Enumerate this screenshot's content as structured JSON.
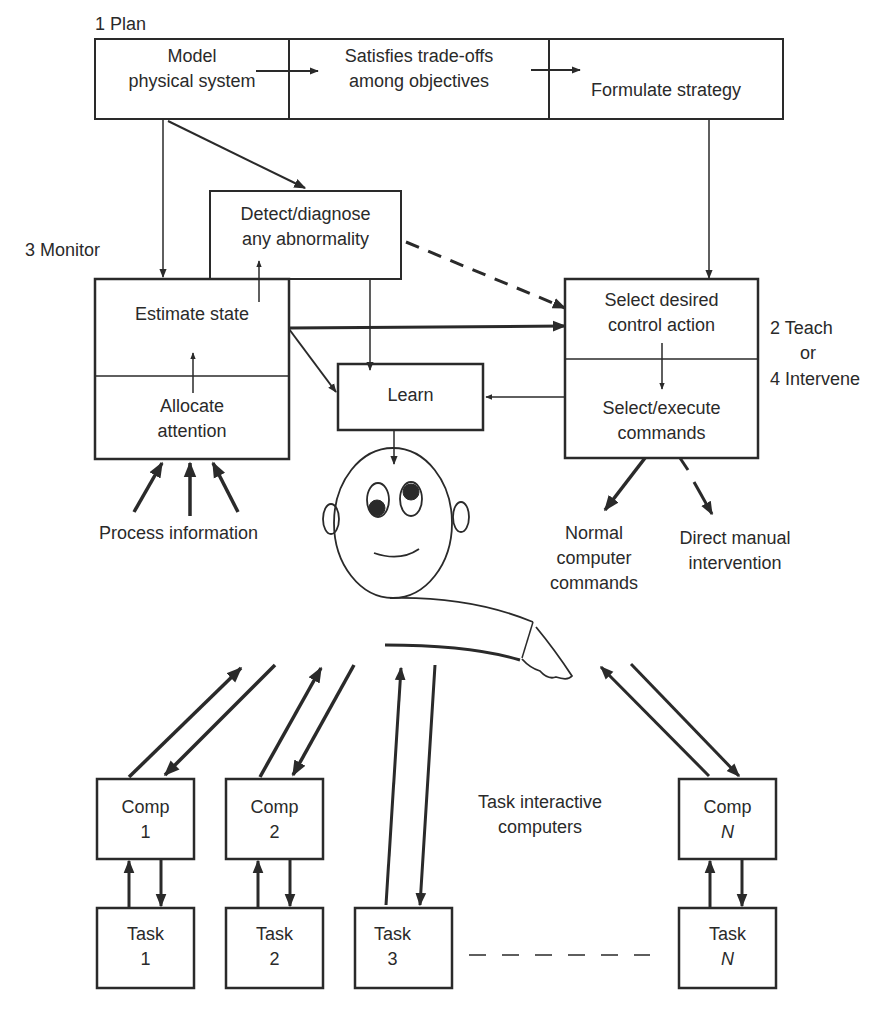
{
  "diagram": {
    "type": "supervisory-control-diagram",
    "labels": {
      "plan": "1 Plan",
      "monitor": "3 Monitor",
      "teach": "2 Teach",
      "or": "or",
      "intervene": "4 Intervene",
      "process_information": "Process information",
      "task_interactive": [
        "Task interactive",
        "computers"
      ]
    },
    "plan_boxes": [
      {
        "lines": [
          "Model",
          "physical system"
        ]
      },
      {
        "lines": [
          "Satisfies trade-offs",
          "among objectives"
        ]
      },
      {
        "lines": [
          "Formulate strategy"
        ]
      }
    ],
    "detect_box": {
      "lines": [
        "Detect/diagnose",
        "any abnormality"
      ]
    },
    "monitor_box": {
      "top": {
        "lines": [
          "Estimate state"
        ]
      },
      "bottom": {
        "lines": [
          "Allocate",
          "attention"
        ]
      }
    },
    "learn_box": {
      "lines": [
        "Learn"
      ]
    },
    "control_box": {
      "top": {
        "lines": [
          "Select desired",
          "control action"
        ]
      },
      "bottom": {
        "lines": [
          "Select/execute",
          "commands"
        ]
      }
    },
    "outputs": {
      "normal": [
        "Normal",
        "computer",
        "commands"
      ],
      "direct": [
        "Direct manual",
        "intervention"
      ]
    },
    "computers": [
      {
        "label": "Comp",
        "index": "1"
      },
      {
        "label": "Comp",
        "index": "2"
      },
      {
        "label": "Comp",
        "index": "N"
      }
    ],
    "tasks": [
      {
        "label": "Task",
        "index": "1"
      },
      {
        "label": "Task",
        "index": "2"
      },
      {
        "label": "Task",
        "index": "3"
      },
      {
        "label": "Task",
        "index": "N"
      }
    ],
    "colors": {
      "ink": "#2a2a2a",
      "background": "#ffffff"
    }
  }
}
